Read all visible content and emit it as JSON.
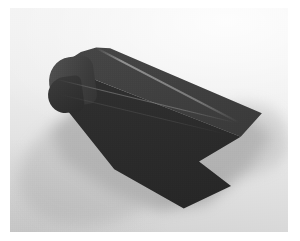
{
  "image": {
    "kind": "photograph",
    "caption": "Dark charcoal extruded angle profile with a rounded nose and a V-notched end, resting on a light gray studio surface",
    "subject_name": "charcoal-angle-profile",
    "orientation": "three-quarter view, long axis running from lower-left to upper-right",
    "frame": {
      "border_color": "#ffffff",
      "plate_left": 10,
      "plate_top": 8,
      "plate_width": 278,
      "plate_height": 224
    },
    "palette": {
      "page_background": "#ffffff",
      "backdrop_light": "#f3f3f3",
      "backdrop_mid": "#e6e6e6",
      "backdrop_dark": "#d2d2d2",
      "shadow": "#8e8e8e",
      "object_top_face": "#434343",
      "object_front_face": "#2b2b2b",
      "object_nose_highlight": "#545454",
      "crease_highlight": "#969696"
    },
    "object_features": [
      {
        "name": "rounded-nose",
        "description": "curved closed left end of the extrusion"
      },
      {
        "name": "top-face",
        "description": "upper sloping plane catching the light"
      },
      {
        "name": "front-face",
        "description": "lower vertical plane in shade"
      },
      {
        "name": "fold-crease",
        "description": "long crease where the two planes meet"
      },
      {
        "name": "v-notch",
        "description": "wedge cut removed from the far right end"
      },
      {
        "name": "cast-shadow",
        "description": "soft gray shadow spreading to the lower left and right"
      }
    ],
    "lighting": {
      "key_direction": "upper right",
      "shadow_direction": "lower left",
      "quality": "soft diffuse"
    }
  }
}
